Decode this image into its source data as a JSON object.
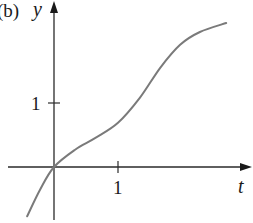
{
  "figure": {
    "panel_label": "(b)",
    "y_axis_label": "y",
    "x_axis_label": "t",
    "x_tick_label": "1",
    "y_tick_label": "1"
  },
  "chart_data": {
    "type": "line",
    "title": "",
    "panel_label": "(b)",
    "xlabel": "t",
    "ylabel": "y",
    "x_ticks": [
      1
    ],
    "y_ticks": [
      1
    ],
    "xlim": [
      -0.85,
      2.95
    ],
    "ylim": [
      -0.88,
      2.6
    ],
    "grid": false,
    "legend": null,
    "series": [
      {
        "name": "y(t)",
        "color": "#7a7a7a",
        "x": [
          -0.42,
          -0.22,
          0.0,
          0.33,
          0.64,
          1.0,
          1.34,
          1.66,
          1.97,
          2.28,
          2.69
        ],
        "y": [
          -0.77,
          -0.36,
          0.0,
          0.27,
          0.45,
          0.69,
          1.08,
          1.55,
          1.91,
          2.11,
          2.25
        ]
      }
    ]
  }
}
